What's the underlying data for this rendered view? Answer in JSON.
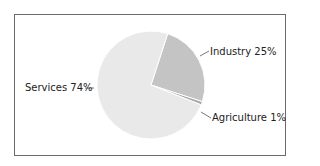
{
  "chart_data": {
    "type": "pie",
    "title": "",
    "categories": [
      "Services",
      "Industry",
      "Agriculture"
    ],
    "values": [
      74,
      25,
      1
    ],
    "labels": [
      "Services 74%",
      "Industry 25%",
      "Agriculture 1%"
    ],
    "colors": [
      "#e9e9e9",
      "#c4c4c4",
      "#a8a8a8"
    ],
    "legend": "none",
    "border": true
  },
  "labels": {
    "services": "Services 74%",
    "industry": "Industry 25%",
    "agriculture": "Agriculture 1%"
  }
}
